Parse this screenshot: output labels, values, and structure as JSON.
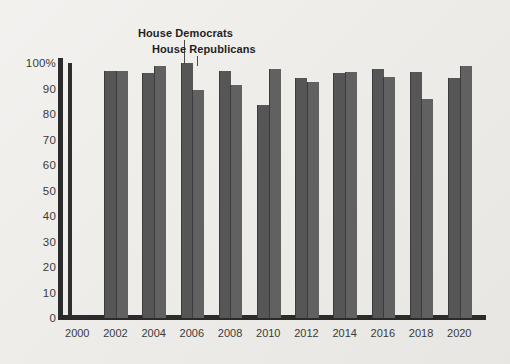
{
  "chart_data": {
    "type": "bar",
    "title": "",
    "xlabel": "",
    "ylabel": "",
    "categories": [
      "2000",
      "2002",
      "2004",
      "2006",
      "2008",
      "2010",
      "2012",
      "2014",
      "2016",
      "2018",
      "2020"
    ],
    "ylim": [
      0,
      100
    ],
    "yticks": [
      "0",
      "10",
      "20",
      "30",
      "40",
      "50",
      "60",
      "70",
      "80",
      "90",
      "100%"
    ],
    "ytick_values": [
      0,
      10,
      20,
      30,
      40,
      50,
      60,
      70,
      80,
      90,
      100
    ],
    "grid": false,
    "legend_position": "annotation-top-center",
    "series": [
      {
        "name": "House Democrats",
        "values": [
          100,
          97,
          96,
          100,
          97,
          83.5,
          94,
          96,
          97.5,
          96.5,
          94
        ]
      },
      {
        "name": "House Republicans",
        "values": [
          100,
          97,
          99,
          89.5,
          91.5,
          97.5,
          92.5,
          96.5,
          94.5,
          86,
          99
        ]
      }
    ],
    "annotations": [
      {
        "text": "House Democrats",
        "points_to": "2004-democrats-bar"
      },
      {
        "text": "House Republicans",
        "points_to": "2004-republicans-bar"
      }
    ],
    "colors": {
      "democrats": "#565656",
      "republicans": "#616161",
      "axis": "#2b2b2b",
      "background": "#eceae6",
      "text": "#3a3a3a",
      "annotation_text": "#1f1f1f"
    }
  }
}
